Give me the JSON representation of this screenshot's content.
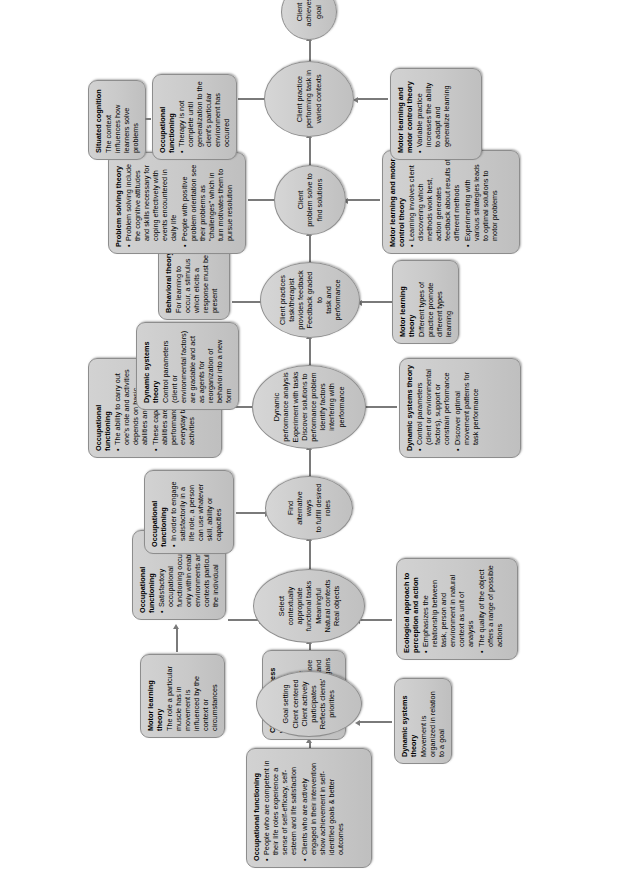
{
  "diagram": {
    "orientation": "rotated-90-ccw",
    "accent": "#c9c9c9",
    "line_color": "#7a7a7a"
  },
  "spine": [
    {
      "id": "goal-setting",
      "lines": [
        "Goal setting",
        "Client centered",
        "Client actively",
        "participates",
        "Reflects clients'",
        "priorities"
      ]
    },
    {
      "id": "select-tasks",
      "lines": [
        "Select",
        "contextually appropriate",
        "functional tasks",
        "Meaningful",
        "Natural contexts",
        "Real objects"
      ]
    },
    {
      "id": "find-alternatives",
      "lines": [
        "Find",
        "alternative ways",
        "to fulfill desired",
        "roles"
      ]
    },
    {
      "id": "dynamic-performance-analysis",
      "lines": [
        "Dynamic",
        "performance analysis",
        "Experiment with tasks",
        "Discover solutions to",
        "performance problem",
        "Identify factors",
        "interfering with",
        "performance"
      ]
    },
    {
      "id": "client-practices",
      "lines": [
        "Client practices",
        "task/therapist",
        "provides feedback",
        "Feedback graded to",
        "task and",
        "performance"
      ]
    },
    {
      "id": "client-problem-solve",
      "lines": [
        "Client",
        "problem solve to",
        "find solutions"
      ]
    },
    {
      "id": "client-varied-contexts",
      "lines": [
        "Client practice",
        "performing task in",
        "varied contexts"
      ]
    },
    {
      "id": "client-achieves-goal",
      "lines": [
        "Client",
        "achieves",
        "goal"
      ]
    }
  ],
  "boxes": {
    "occupational_functioning_1": {
      "title": "Occupational functioning",
      "bullets": [
        "People who are competent in their life roles experience a sense of self-efficacy, self-esteem and life satisfaction",
        "Clients who are actively engaged in their intervention show achievement in self-identified goals & better outcomes"
      ]
    },
    "client_centredness": {
      "title": "Client centredness",
      "body": "When clients and therapists work together to achieve goals, clients are more engaged, satisfied and make meaningful gains"
    },
    "dynamic_systems_theory_1": {
      "title": "Dynamic systems theory",
      "body": "Movement is organized in relation to a goal"
    },
    "motor_learning_theory_1": {
      "title": "Motor learning theory",
      "body": "The role a particular muscle has in movement is influenced by the context or circumstances"
    },
    "occupational_functioning_2": {
      "title": "Occupational functioning",
      "bullets": [
        "Satisfactory occupational functioning occurs only within enabling environments and contexts particular to the individual"
      ]
    },
    "ecological_approach": {
      "title": "Ecological approach to perception and action",
      "bullets": [
        "Emphasizes the relationship between task, person and environment in natural context as unit of analysis",
        "The quality of the object offers a range of possible actions"
      ]
    },
    "occupational_functioning_3": {
      "title": "Occupational functioning",
      "bullets": [
        "In order to engage satisfactorily in a life role, a person can use whatever skill, ability or capacities"
      ]
    },
    "occupational_functioning_4": {
      "title": "Occupational functioning",
      "bullets": [
        "The ability to carry out one's role and activities depends on basic abilities and capacities",
        "These capacities and abilities are related to performance of everyday tasks and activities"
      ]
    },
    "dynamic_systems_theory_2": {
      "title": "Dynamic systems theory",
      "bullets": [
        "Control parameters (client or environmental factors), support or constrain performance",
        "Discover optimal movement patterns for task performance"
      ]
    },
    "dynamic_systems_theory_3": {
      "title": "Dynamic systems theory",
      "body": "Control parameters (client or environmental factors) are gradable and act as agents for reorganization of behavior into a new form"
    },
    "behavioral_theory": {
      "title": "Behavioral theory",
      "body": "For learning to occur, a stimulus which elicits a response must be present"
    },
    "motor_learning_theory_2": {
      "title": "Motor learning theory",
      "body": "Different types of practice promote different types learning"
    },
    "problem_solving_theory": {
      "title": "Problem solving theory",
      "bullets": [
        "Problem solving include the cognitive attitudes and skills necessary for coping effectively with events encountered in daily life",
        "People with positive problem orientation see their problems as \"challenges\" which in turn motivates them to pursue resolution"
      ]
    },
    "motor_learning_motor_control_1": {
      "title": "Motor learning and motor control theory",
      "bullets": [
        "Learning involves client discovering which methods work best, action generates feedback about results of different methods",
        "Experimenting with various strategies leads to optimal solutions to motor problems"
      ]
    },
    "situated_cognition": {
      "title": "Situated cognition",
      "body": "The context influences how learners solve problems"
    },
    "occupational_functioning_5": {
      "title": "Occupational functioning",
      "bullets": [
        "Therapy is not complete until generalization to the client's particular environment has occurred"
      ]
    },
    "motor_learning_motor_control_2": {
      "title": "Motor learning and motor control theory",
      "bullets": [
        "Variable practice increases the ability to adapt and generalize learning"
      ]
    }
  }
}
